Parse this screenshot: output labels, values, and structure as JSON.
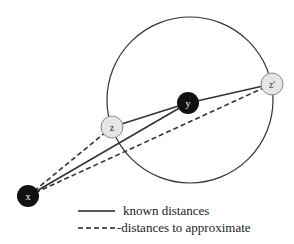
{
  "diagram": {
    "circle": {
      "cx": 190,
      "cy": 100,
      "r": 83
    },
    "nodes": [
      {
        "id": "x",
        "label": "x",
        "cx": 28,
        "cy": 196,
        "fill": "#111111",
        "text_color": "#ffffff"
      },
      {
        "id": "z",
        "label": "z",
        "cx": 112,
        "cy": 127,
        "fill": "#e6e6e6",
        "text_color": "#333333"
      },
      {
        "id": "y",
        "label": "y",
        "cx": 188,
        "cy": 103,
        "fill": "#111111",
        "text_color": "#ffffff"
      },
      {
        "id": "z_prime",
        "label": "z'",
        "cx": 272,
        "cy": 84,
        "fill": "#e6e6e6",
        "text_color": "#333333"
      }
    ],
    "edges": [
      {
        "from": "x",
        "to": "y",
        "style": "solid",
        "meaning": "known distance"
      },
      {
        "from": "z",
        "to": "y",
        "style": "solid",
        "meaning": "known distance"
      },
      {
        "from": "y",
        "to": "z_prime",
        "style": "solid",
        "meaning": "known distance"
      },
      {
        "from": "x",
        "to": "z",
        "style": "dashed",
        "meaning": "distance to approximate"
      },
      {
        "from": "x",
        "to": "z_prime",
        "style": "dashed",
        "meaning": "distance to approximate"
      }
    ]
  },
  "legend": {
    "solid_label": "known distances",
    "dashed_label": "-distances to approximate"
  },
  "colors": {
    "line": "#333333",
    "node_dark": "#111111",
    "node_light": "#e6e6e6"
  }
}
